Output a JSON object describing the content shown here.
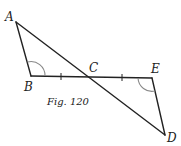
{
  "figure": {
    "caption": "Fig. 120",
    "points": {
      "A": {
        "label": "A",
        "x": 16,
        "y": 22
      },
      "B": {
        "label": "B",
        "x": 31,
        "y": 76
      },
      "C": {
        "label": "C",
        "x": 93,
        "y": 77
      },
      "E": {
        "label": "E",
        "x": 152,
        "y": 78
      },
      "D": {
        "label": "D",
        "x": 165,
        "y": 135
      }
    },
    "segments": [
      "AB",
      "AD",
      "BE",
      "ED"
    ],
    "markings": {
      "equal_ticks": [
        "BC",
        "CE"
      ],
      "angle_arcs": [
        "B",
        "E"
      ]
    },
    "colors": {
      "line": "#222222",
      "arc": "#888888"
    }
  }
}
